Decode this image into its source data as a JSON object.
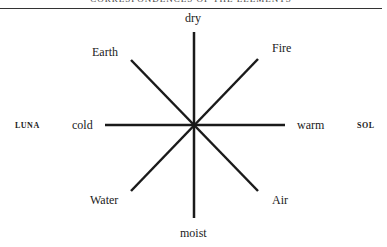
{
  "header": {
    "running_head": "CORRESPONDENCES OF THE ELEMENTS"
  },
  "diagram": {
    "axes": {
      "top": "dry",
      "bottom": "moist",
      "left": "cold",
      "right": "warm"
    },
    "elements": {
      "top_left": "Earth",
      "top_right": "Fire",
      "bottom_left": "Water",
      "bottom_right": "Air"
    },
    "poles": {
      "left": "LUNA",
      "right": "SOL"
    },
    "line_color": "#1a1a1a"
  }
}
